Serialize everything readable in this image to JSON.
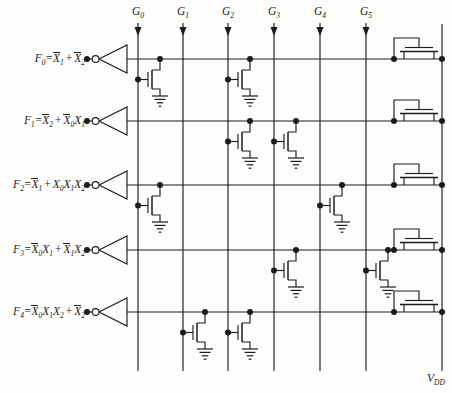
{
  "figure": {
    "title_semantics": "NMOS NOR-array PLA output plane with depletion loads",
    "background": "#fdfdfc",
    "ink": "#1c1c1c",
    "canvas": {
      "width": 452,
      "height": 393
    },
    "columns": [
      {
        "base": "G",
        "sub": "0",
        "x": 138
      },
      {
        "base": "G",
        "sub": "1",
        "x": 183
      },
      {
        "base": "G",
        "sub": "2",
        "x": 228
      },
      {
        "base": "G",
        "sub": "3",
        "x": 274
      },
      {
        "base": "G",
        "sub": "4",
        "x": 320
      },
      {
        "base": "G",
        "sub": "5",
        "x": 366
      }
    ],
    "column_top": 23,
    "column_bottom": 371,
    "vdd": {
      "base": "V",
      "sub": "DD",
      "x": 442,
      "label_x": 427,
      "label_y": 371
    },
    "rows": [
      {
        "base": "F",
        "sub": "0",
        "y": 59,
        "expr": [
          {
            "v": "X",
            "s": "1",
            "bar": true
          },
          {
            "op": "+"
          },
          {
            "v": "X",
            "s": "2",
            "bar": true
          }
        ]
      },
      {
        "base": "F",
        "sub": "1",
        "y": 121,
        "expr": [
          {
            "v": "X",
            "s": "2",
            "bar": true
          },
          {
            "op": "+"
          },
          {
            "v": "X",
            "s": "0",
            "bar": true
          },
          {
            "v": "X",
            "s": "1",
            "bar": false
          }
        ]
      },
      {
        "base": "F",
        "sub": "2",
        "y": 185,
        "expr": [
          {
            "v": "X",
            "s": "1",
            "bar": true
          },
          {
            "op": "+"
          },
          {
            "v": "X",
            "s": "0",
            "bar": false
          },
          {
            "v": "X",
            "s": "1",
            "bar": false
          },
          {
            "v": "X",
            "s": "2",
            "bar": false
          }
        ]
      },
      {
        "base": "F",
        "sub": "3",
        "y": 250,
        "expr": [
          {
            "v": "X",
            "s": "0",
            "bar": true
          },
          {
            "v": "X",
            "s": "1",
            "bar": false
          },
          {
            "op": "+"
          },
          {
            "v": "X",
            "s": "1",
            "bar": true
          },
          {
            "v": "X",
            "s": "2",
            "bar": false
          }
        ]
      },
      {
        "base": "F",
        "sub": "4",
        "y": 312,
        "expr": [
          {
            "v": "X",
            "s": "0",
            "bar": true
          },
          {
            "v": "X",
            "s": "1",
            "bar": false
          },
          {
            "v": "X",
            "s": "2",
            "bar": false
          },
          {
            "op": "+"
          },
          {
            "v": "X",
            "s": "2",
            "bar": true
          }
        ]
      }
    ],
    "inverter": {
      "dot_x": 87,
      "bubble_x": 95.6,
      "bubble_r": 3.4,
      "apex_x": 99,
      "back_x": 127,
      "half_height": 14
    },
    "row_line_right_x": 442,
    "pulldown_transistors": [
      {
        "row": 0,
        "col": 0
      },
      {
        "row": 0,
        "col": 2
      },
      {
        "row": 1,
        "col": 2
      },
      {
        "row": 1,
        "col": 3
      },
      {
        "row": 2,
        "col": 0
      },
      {
        "row": 2,
        "col": 4
      },
      {
        "row": 3,
        "col": 3
      },
      {
        "row": 3,
        "col": 5
      },
      {
        "row": 4,
        "col": 1
      },
      {
        "row": 4,
        "col": 2
      }
    ],
    "load_transistor_rows": [
      0,
      1,
      2,
      3,
      4
    ],
    "load_geometry": {
      "source_x": 394,
      "drain_x": 442,
      "stub_left_x": 404,
      "stub_right_x": 434,
      "channel_x1": 400,
      "channel_x2": 438,
      "gate_x1": 405,
      "gate_x2": 433,
      "loop_mid_x": 419
    }
  }
}
